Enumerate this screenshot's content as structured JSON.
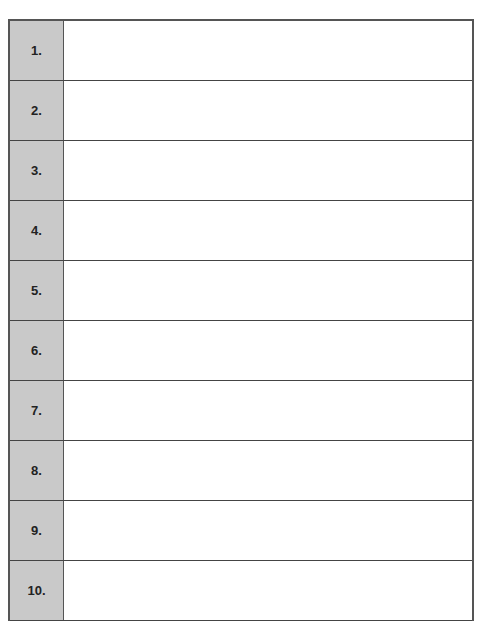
{
  "table": {
    "rows": [
      {
        "label": "1.",
        "value": ""
      },
      {
        "label": "2.",
        "value": ""
      },
      {
        "label": "3.",
        "value": ""
      },
      {
        "label": "4.",
        "value": ""
      },
      {
        "label": "5.",
        "value": ""
      },
      {
        "label": "6.",
        "value": ""
      },
      {
        "label": "7.",
        "value": ""
      },
      {
        "label": "8.",
        "value": ""
      },
      {
        "label": "9.",
        "value": ""
      },
      {
        "label": "10.",
        "value": ""
      }
    ]
  },
  "colors": {
    "label_bg": "#c9c9c9",
    "border": "#444444"
  }
}
